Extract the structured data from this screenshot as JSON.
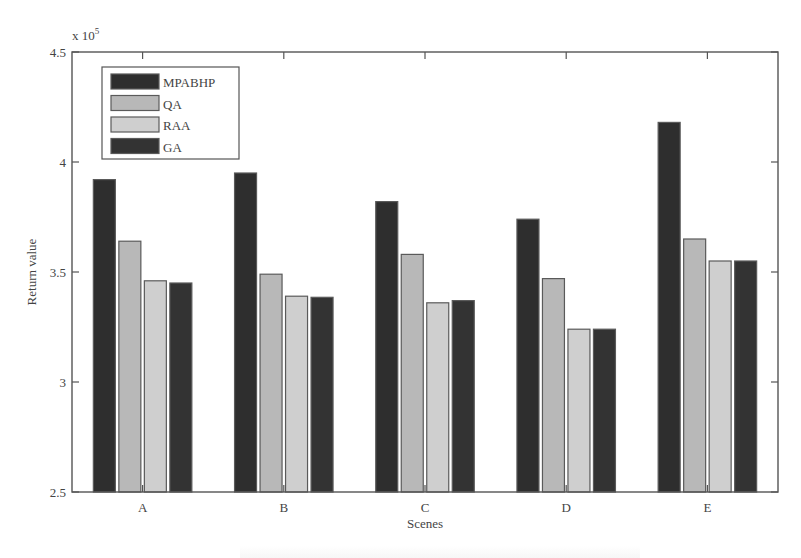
{
  "chart_data": {
    "type": "bar",
    "title": "",
    "xlabel": "Scenes",
    "ylabel": "Return value",
    "y_multiplier_label": "x 10",
    "y_multiplier_exponent": "5",
    "ylim": [
      2.5,
      4.5
    ],
    "yticks": [
      2.5,
      3,
      3.5,
      4,
      4.5
    ],
    "ytick_labels": [
      "2.5",
      "3",
      "3.5",
      "4",
      "4.5"
    ],
    "categories": [
      "A",
      "B",
      "C",
      "D",
      "E"
    ],
    "series": [
      {
        "name": "MPABHP",
        "color": "#2e2e2e",
        "values": [
          3.92,
          3.95,
          3.82,
          3.74,
          4.18
        ]
      },
      {
        "name": "QA",
        "color": "#b8b8b8",
        "values": [
          3.64,
          3.49,
          3.58,
          3.47,
          3.65
        ]
      },
      {
        "name": "RAA",
        "color": "#cfcfcf",
        "values": [
          3.46,
          3.39,
          3.36,
          3.24,
          3.55
        ]
      },
      {
        "name": "GA",
        "color": "#333333",
        "values": [
          3.45,
          3.385,
          3.37,
          3.24,
          3.55
        ]
      }
    ],
    "legend_position": "upper-left-inside",
    "grid": false
  }
}
